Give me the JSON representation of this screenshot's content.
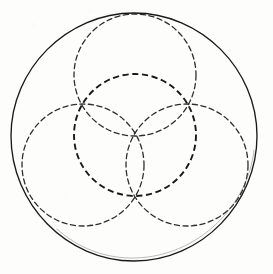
{
  "figure": {
    "title": "Overlapping circles geometric construction",
    "canvas": {
      "width": 273,
      "height": 274
    },
    "background_color": "#fdfdfc",
    "ink_color": "#1a1a1a",
    "ink_color_light": "#3a3a3a"
  },
  "chart_data": {
    "type": "scatter",
    "title": "Overlapping circles geometric construction",
    "xlabel": "",
    "ylabel": "",
    "xlim": [
      0,
      273
    ],
    "ylim": [
      0,
      274
    ],
    "grid": false,
    "legend": "none",
    "units": "pixels",
    "shapes": [
      {
        "name": "outer-circle",
        "role": "boundary",
        "stroke_style": "solid",
        "cx": 134,
        "cy": 136,
        "r": 123,
        "stroke_width": 1.4,
        "color": "#1a1a1a"
      },
      {
        "name": "central-circle",
        "role": "inner",
        "stroke_style": "dashed",
        "cx": 135,
        "cy": 135,
        "r": 61,
        "stroke_width": 1.7,
        "color": "#1a1a1a"
      },
      {
        "name": "petal-circle-top",
        "role": "petal",
        "stroke_style": "dashed",
        "cx": 135,
        "cy": 75,
        "r": 61,
        "angle_deg": 270,
        "stroke_width": 1.3,
        "color": "#2e2e2e"
      },
      {
        "name": "petal-circle-lower-left",
        "role": "petal",
        "stroke_style": "dashed",
        "cx": 83,
        "cy": 165,
        "r": 61,
        "angle_deg": 150,
        "stroke_width": 1.3,
        "color": "#2e2e2e"
      },
      {
        "name": "petal-circle-lower-right",
        "role": "petal",
        "stroke_style": "dashed",
        "cx": 187,
        "cy": 165,
        "r": 61,
        "angle_deg": 30,
        "stroke_width": 1.3,
        "color": "#2e2e2e"
      }
    ],
    "counts": {
      "total_circles": 5,
      "solid_circles": 1,
      "dashed_circles": 4,
      "petal_circles": 3
    }
  }
}
